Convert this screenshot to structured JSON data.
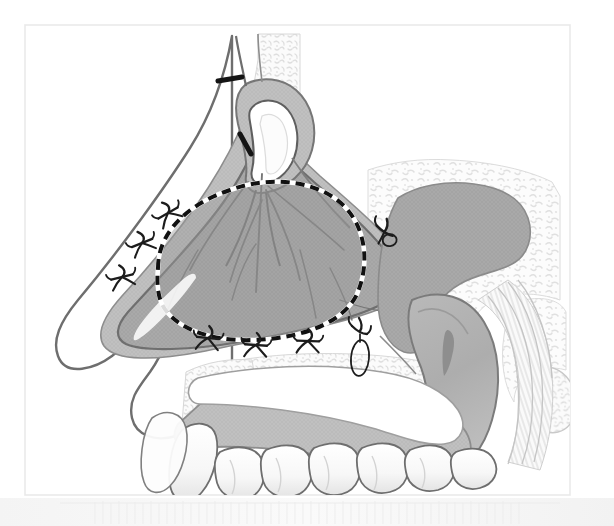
{
  "figure": {
    "title": "Sagittal section of nasal cavity showing septal flap elevation with suture fixation",
    "view": "right lateral sagittal cross-section",
    "caption": "",
    "canvas": {
      "width": 614,
      "height": 526
    },
    "frame": {
      "x": 25,
      "y": 25,
      "width": 545,
      "height": 470,
      "stroke": "#e8e8e8"
    }
  },
  "palette": {
    "background": "#ffffff",
    "paper": "#ffffff",
    "frame_line": "#eaeaea",
    "outline_dark": "#5c5c5c",
    "outline_mid": "#8a8a8a",
    "outline_light": "#c9c9c9",
    "mucosa_mid": "#a9a9a9",
    "mucosa_dark": "#9a9a9a",
    "mucosa_light": "#c2c2c2",
    "skin_pale": "#f3f3f3",
    "bone_fill": "#fafafa",
    "bone_speckle": "#dcdcdc",
    "soft_palate": "#b4b4b4",
    "tongue_fill": "#c6c6c6",
    "tooth_fill": "#fcfcfc",
    "tooth_shade": "#dddddd",
    "suture_black": "#1a1a1a",
    "dashed_black": "#111111",
    "dashed_white": "#ffffff",
    "vessel_line": "#7a7a7a",
    "bottom_strip": "#f6f6f6"
  },
  "anatomy": {
    "labels": [],
    "structures": [
      {
        "name": "nasal-dorsum-skin",
        "kind": "skin"
      },
      {
        "name": "nasal-tip",
        "kind": "skin"
      },
      {
        "name": "columella",
        "kind": "skin"
      },
      {
        "name": "upper-lip",
        "kind": "skin"
      },
      {
        "name": "frontal-bone",
        "kind": "bone"
      },
      {
        "name": "nasal-bone",
        "kind": "bone"
      },
      {
        "name": "cribriform-region",
        "kind": "bone"
      },
      {
        "name": "sphenoid-sinus",
        "kind": "bone"
      },
      {
        "name": "hard-palate",
        "kind": "bone"
      },
      {
        "name": "maxillary-alveolus",
        "kind": "bone"
      },
      {
        "name": "nasal-septum-mucosa",
        "kind": "mucosa"
      },
      {
        "name": "septal-flap",
        "kind": "mucosa"
      },
      {
        "name": "nasopharynx-mucosa",
        "kind": "mucosa"
      },
      {
        "name": "soft-palate",
        "kind": "mucosa"
      },
      {
        "name": "uvula",
        "kind": "mucosa"
      },
      {
        "name": "tongue",
        "kind": "muscle"
      },
      {
        "name": "posterior-pharyngeal-wall",
        "kind": "muscle"
      },
      {
        "name": "upper-teeth",
        "kind": "tooth",
        "count": 7
      },
      {
        "name": "septal-vessels",
        "kind": "vessel",
        "count": 7
      }
    ]
  },
  "markers": {
    "resection_outline": {
      "name": "dashed-resection-outline",
      "style": "black-and-white dashed ellipse",
      "dash_length_px": 9,
      "gap_length_px": 6,
      "stroke_width_px": 4
    },
    "incisions": [
      {
        "name": "superior-incision-mark-1",
        "x": 228,
        "y": 79,
        "angle_deg": 8,
        "length_px": 24
      },
      {
        "name": "superior-incision-mark-2",
        "x": 245,
        "y": 144,
        "angle_deg": 70,
        "length_px": 22
      }
    ],
    "sutures": [
      {
        "name": "suture-knot-left-upper",
        "x": 168,
        "y": 213
      },
      {
        "name": "suture-knot-left-middle",
        "x": 142,
        "y": 243
      },
      {
        "name": "suture-knot-left-lower",
        "x": 122,
        "y": 277
      },
      {
        "name": "suture-knot-bottom-left",
        "x": 208,
        "y": 338
      },
      {
        "name": "suture-knot-bottom-center",
        "x": 256,
        "y": 345
      },
      {
        "name": "suture-knot-bottom-right",
        "x": 308,
        "y": 341
      },
      {
        "name": "suture-knot-posterior-superior",
        "x": 386,
        "y": 230
      },
      {
        "name": "suture-knot-posterior-inferior",
        "x": 360,
        "y": 332
      }
    ],
    "suture_loops": [
      {
        "name": "suture-loop-posterior-superior",
        "cx": 391,
        "cy": 239,
        "rx": 7,
        "ry": 6,
        "angle_deg": -20
      },
      {
        "name": "suture-loop-posterior-inferior",
        "cx": 360,
        "cy": 358,
        "rx": 9,
        "ry": 18,
        "angle_deg": 5
      }
    ]
  },
  "bottom_strip": {
    "name": "page-edge-texture",
    "y": 498,
    "height": 28
  }
}
